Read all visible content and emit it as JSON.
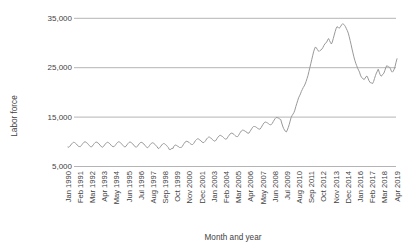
{
  "chart_data": {
    "type": "line",
    "title": "",
    "xlabel": "Month and year",
    "ylabel": "Labor force",
    "ylim": [
      5000,
      35000
    ],
    "grid": "horizontal-only",
    "legend_position": "none",
    "line_color": "#999999",
    "grid_color": "#9b9b9b",
    "text_color": "#3f3f3f",
    "y_ticks": [
      5000,
      15000,
      25000,
      35000
    ],
    "y_tick_labels": [
      "5,000",
      "15,000",
      "25,000",
      "35,000"
    ],
    "x_tick_labels": [
      "Jan 1990",
      "Feb 1991",
      "Mar 1992",
      "Apr 1993",
      "May 1994",
      "Jun 1995",
      "Jul 1996",
      "Aug 1997",
      "Sep 1998",
      "Oct 1999",
      "Nov 2000",
      "Dec 2001",
      "Jan 2003",
      "Feb 2004",
      "Mar 2005",
      "Apr 2006",
      "May 2007",
      "Jun 2008",
      "Jul 2009",
      "Aug 2010",
      "Sep 2011",
      "Oct 2012",
      "Nov 2013",
      "Dec 2014",
      "Jan 2016",
      "Feb 2017",
      "Mar 2018",
      "Apr 2019"
    ],
    "x_tick_interval_months": 13,
    "series": [
      {
        "name": "Labor force",
        "x_start_label": "Jan 1990",
        "x_end_label": "Apr 2019",
        "frequency": "monthly",
        "values": [
          8950,
          8900,
          9100,
          9350,
          9600,
          9800,
          9900,
          9850,
          9700,
          9550,
          9300,
          9100,
          9050,
          9000,
          9200,
          9450,
          9700,
          9900,
          10000,
          9950,
          9800,
          9650,
          9400,
          9200,
          9000,
          8950,
          9150,
          9400,
          9650,
          9850,
          9950,
          9900,
          9750,
          9600,
          9350,
          9150,
          8950,
          8900,
          9100,
          9350,
          9600,
          9800,
          9900,
          9850,
          9700,
          9550,
          9300,
          9100,
          9050,
          9000,
          9200,
          9450,
          9700,
          9900,
          10000,
          9950,
          9800,
          9650,
          9400,
          9200,
          9000,
          8950,
          9150,
          9400,
          9650,
          9850,
          9950,
          9900,
          9750,
          9600,
          9350,
          9150,
          8950,
          8900,
          9100,
          9350,
          9600,
          9800,
          9900,
          9850,
          9700,
          9550,
          9300,
          9100,
          8850,
          8800,
          9000,
          9250,
          9500,
          9700,
          9800,
          9750,
          9600,
          9450,
          9200,
          9000,
          8700,
          8650,
          8850,
          9100,
          9350,
          9550,
          9650,
          9600,
          9450,
          9300,
          9050,
          8850,
          8450,
          8400,
          8550,
          8700,
          8650,
          9100,
          9300,
          9350,
          9250,
          9150,
          8950,
          8850,
          8850,
          8850,
          9100,
          9400,
          9700,
          9950,
          10100,
          10100,
          10000,
          9900,
          9700,
          9550,
          9450,
          9450,
          9650,
          9950,
          10250,
          10450,
          10600,
          10600,
          10450,
          10350,
          10150,
          9950,
          9850,
          9850,
          10050,
          10300,
          10600,
          10800,
          10950,
          10950,
          10800,
          10700,
          10450,
          10300,
          10150,
          10150,
          10350,
          10650,
          10950,
          11150,
          11300,
          11300,
          11150,
          11050,
          10850,
          10650,
          10550,
          10550,
          10800,
          11100,
          11350,
          11600,
          11750,
          11750,
          11650,
          11500,
          11300,
          11150,
          11050,
          11050,
          11300,
          11650,
          11950,
          12200,
          12350,
          12350,
          12250,
          12200,
          12000,
          11850,
          11750,
          11750,
          12050,
          12350,
          12650,
          12950,
          13100,
          13100,
          13050,
          12950,
          12750,
          12650,
          12550,
          12600,
          12850,
          13200,
          13500,
          13800,
          13950,
          14000,
          13900,
          13800,
          13650,
          13500,
          13450,
          13500,
          13750,
          14100,
          14400,
          14700,
          14900,
          14900,
          14850,
          14750,
          14600,
          14500,
          13800,
          13200,
          12700,
          12400,
          12100,
          12000,
          12400,
          12900,
          13500,
          14200,
          14900,
          15300,
          15600,
          15900,
          16400,
          17100,
          17700,
          18300,
          18900,
          19300,
          19700,
          20200,
          20600,
          21000,
          21300,
          21700,
          22200,
          22800,
          23400,
          24200,
          25000,
          25800,
          26600,
          27400,
          28200,
          28800,
          29200,
          29000,
          28700,
          28400,
          28300,
          28500,
          28600,
          28800,
          29100,
          29500,
          29800,
          30000,
          30200,
          30600,
          30900,
          30500,
          30100,
          29800,
          30200,
          30900,
          31600,
          32300,
          32900,
          33300,
          33200,
          33000,
          33100,
          33400,
          33700,
          33900,
          33800,
          33600,
          33300,
          32900,
          32500,
          32000,
          31300,
          30500,
          29700,
          28800,
          28000,
          27200,
          26500,
          25900,
          25400,
          24900,
          24500,
          24100,
          23500,
          23100,
          22900,
          22700,
          22600,
          22900,
          23200,
          23300,
          22900,
          22400,
          22100,
          21900,
          21900,
          21800,
          22200,
          22800,
          23400,
          23900,
          24300,
          24700,
          24100,
          23600,
          23300,
          23400,
          23700,
          23900,
          24400,
          25000,
          25400,
          25300,
          25200,
          25100,
          24800,
          24300,
          24100,
          24300,
          24700,
          25300,
          26100,
          26800
        ]
      }
    ]
  }
}
